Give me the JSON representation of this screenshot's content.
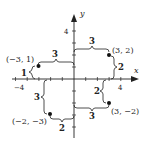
{
  "axes": {
    "x_label": "x",
    "y_label": "y",
    "x_tick_labels": [
      {
        "value": -4,
        "text": "−4"
      },
      {
        "value": 4,
        "text": "4"
      }
    ],
    "y_tick_labels": [
      {
        "value": 4,
        "text": "4"
      }
    ]
  },
  "points": [
    {
      "label": "(3, 2)",
      "x": 3,
      "y": 2
    },
    {
      "label": "(−3, 1)",
      "x": -3,
      "y": 1
    },
    {
      "label": "(3, −2)",
      "x": 3,
      "y": -2
    },
    {
      "label": "(−2, −3)",
      "x": -2,
      "y": -3
    }
  ],
  "braces": {
    "p1_horizontal": "3",
    "p1_vertical": "2",
    "p2_horizontal": "3",
    "p2_vertical": "1",
    "p3_horizontal": "3",
    "p3_vertical": "2",
    "p4_horizontal": "2",
    "p4_vertical": "3"
  },
  "colors": {
    "ink": "#222222",
    "background": "#ffffff"
  }
}
